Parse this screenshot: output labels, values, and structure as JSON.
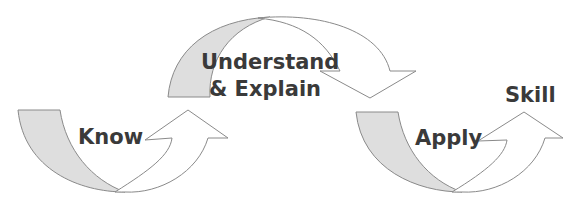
{
  "diagram": {
    "type": "process-flow",
    "stages": [
      {
        "label": "Know"
      },
      {
        "label_line1": "Understand",
        "label_line2": "& Explain"
      },
      {
        "label": "Apply"
      }
    ],
    "outcome": {
      "label": "Skill"
    },
    "colors": {
      "stroke": "#8a8a8a",
      "shade": "#dedede",
      "fill": "#ffffff",
      "text": "#3a3a3a"
    }
  }
}
